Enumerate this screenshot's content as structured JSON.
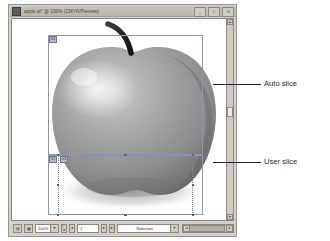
{
  "window": {
    "title": "apple.ai* @ 100% (CMYK/Preview)",
    "icon": "document-icon",
    "controls": {
      "minimize": "_",
      "maximize": "□",
      "close": "✕"
    }
  },
  "canvas": {
    "image_subject": "apple",
    "slices": [
      {
        "id": "auto-slice",
        "badge": "01",
        "type": "auto"
      },
      {
        "id": "user-slice",
        "badge": "02",
        "type": "user"
      },
      {
        "id": "user-slice-inner",
        "badge": "03",
        "type": "user"
      }
    ]
  },
  "scrollbars": {
    "vertical": {
      "up": "▲",
      "down": "▼"
    },
    "horizontal": {
      "left": "◄",
      "right": "►"
    }
  },
  "status_bar": {
    "view_icon": "page-view-icon",
    "grid_icon": "grid-view-icon",
    "zoom": "100%",
    "first_page": "|◄",
    "prev_page": "◄",
    "page_value": "1",
    "next_page": "►",
    "last_page": "►|",
    "mode": "Selection",
    "dropdown_arrow": "▼"
  },
  "annotations": [
    {
      "label": "Auto slice"
    },
    {
      "label": "User slice"
    }
  ]
}
